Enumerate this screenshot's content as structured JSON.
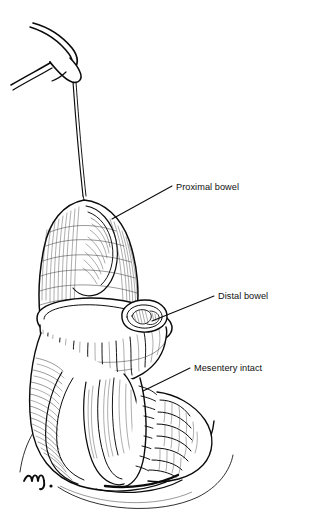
{
  "figure": {
    "kind": "medical-line-illustration",
    "background_color": "#ffffff",
    "ink_color": "#0b0b0b",
    "signature": "m."
  },
  "labels": [
    {
      "id": "proximal-bowel",
      "text": "Proximal bowel",
      "text_x": 176,
      "text_y": 190,
      "leader": "M172,186 L112,219"
    },
    {
      "id": "distal-bowel",
      "text": "Distal bowel",
      "text_x": 218,
      "text_y": 299,
      "leader": "M214,296 L152,321"
    },
    {
      "id": "mesentery-intact",
      "text": "Mesentery intact",
      "text_x": 194,
      "text_y": 371,
      "leader": "M190,368 L143,391"
    }
  ],
  "structures": [
    {
      "id": "support-rod",
      "name": "Surgical support rod"
    },
    {
      "id": "suture-strand",
      "name": "Suture strand"
    },
    {
      "id": "proximal-stump",
      "name": "Everted proximal bowel stump"
    },
    {
      "id": "stoma-collar",
      "name": "Stoma collar / mucocutaneous junction"
    },
    {
      "id": "distal-opening",
      "name": "Distal bowel lumen"
    },
    {
      "id": "mesentery",
      "name": "Intact mesentery"
    },
    {
      "id": "abdominal-wall",
      "name": "Abdominal wall contour"
    }
  ]
}
